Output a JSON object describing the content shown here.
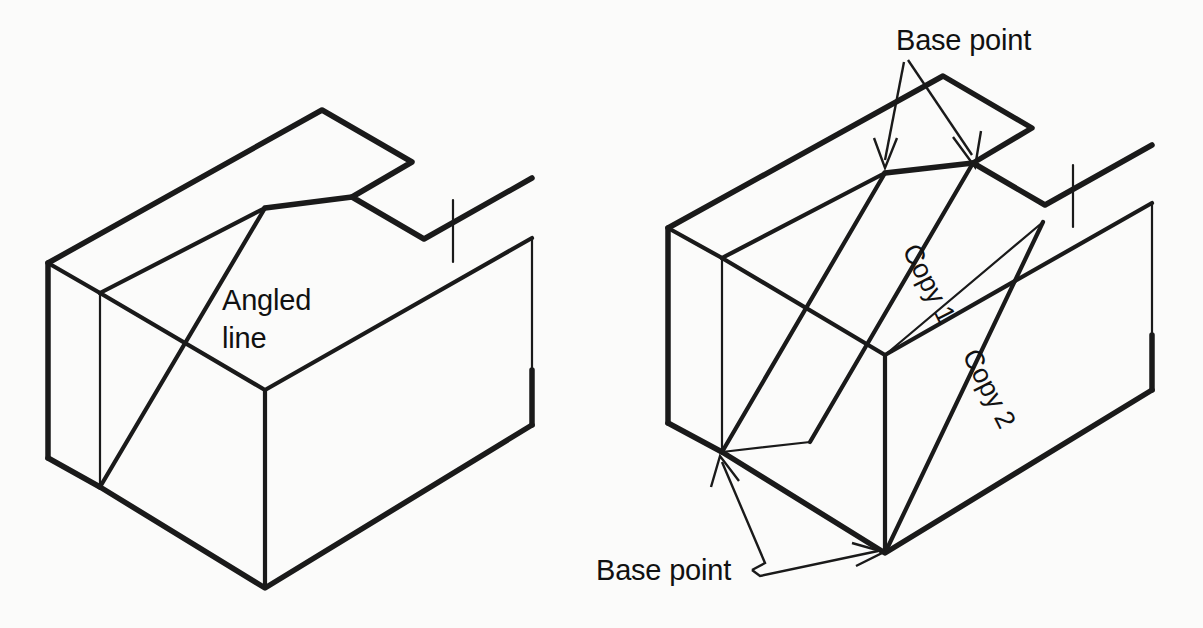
{
  "page": {
    "background_color": "#fbfbfa",
    "line_color": "#1a1a1a",
    "width": 1203,
    "height": 628
  },
  "figures": [
    {
      "id": "left-figure",
      "name": "block-with-angled-line",
      "description": "Isometric rectangular block with a notched top face and a single angled line drawn across the top face",
      "labels": [
        {
          "id": "angled-line-label-1",
          "text": "Angled",
          "x": 222,
          "y": 310
        },
        {
          "id": "angled-line-label-2",
          "text": "line",
          "x": 222,
          "y": 348
        }
      ]
    },
    {
      "id": "right-figure",
      "name": "block-with-copied-lines",
      "description": "Same isometric block showing the angled line copied twice across the top face",
      "labels": [
        {
          "id": "base-point-top",
          "text": "Base point",
          "x": 896,
          "y": 50
        },
        {
          "id": "base-point-bottom",
          "text": "Base point",
          "x": 596,
          "y": 580
        },
        {
          "id": "copy-1",
          "text": "Copy 1",
          "rotation": -63
        },
        {
          "id": "copy-2",
          "text": "Copy 2",
          "rotation": -63
        }
      ]
    }
  ],
  "annotations": {
    "base_point_label": "Base point",
    "copy_1_label": "Copy 1",
    "copy_2_label": "Copy 2",
    "angled_word": "Angled",
    "line_word": "line"
  }
}
